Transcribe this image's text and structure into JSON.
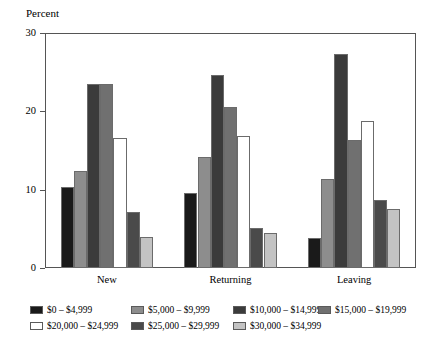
{
  "chart_data": {
    "type": "bar",
    "title": "",
    "subtitle": "",
    "xlabel": "",
    "ylabel": "Percent",
    "categories": [
      "New",
      "Returning",
      "Leaving"
    ],
    "ylim": [
      0,
      30
    ],
    "yticks": [
      0,
      10,
      20,
      30
    ],
    "ytick_labels": [
      "0",
      "10",
      "20",
      "30"
    ],
    "grid": false,
    "legend_position": "bottom",
    "series": [
      {
        "name": "$0 – $4,999",
        "color": "#1a1a1a",
        "values": [
          10.3,
          9.6,
          3.8
        ]
      },
      {
        "name": "$5,000 – $9,999",
        "color": "#8d8d8d",
        "values": [
          12.4,
          14.2,
          11.4
        ]
      },
      {
        "name": "$10,000 – $14,999",
        "color": "#3b3b3b",
        "values": [
          23.5,
          24.6,
          27.3
        ]
      },
      {
        "name": "$15,000 – $19,999",
        "color": "#707070",
        "values": [
          23.5,
          20.5,
          16.3
        ]
      },
      {
        "name": "$20,000 – $24,999",
        "color": "#ffffff",
        "values": [
          16.6,
          16.9,
          18.8
        ]
      },
      {
        "name": "$25,000 – $29,999",
        "color": "#4a4a4a",
        "values": [
          7.2,
          5.1,
          8.7
        ]
      },
      {
        "name": "$30,000 – $34,999",
        "color": "#c3c3c3",
        "values": [
          3.9,
          4.5,
          7.5
        ]
      }
    ]
  },
  "legend": {
    "rows": [
      [
        {
          "label": "$0 – $4,999",
          "color": "#1a1a1a",
          "left": 0
        },
        {
          "label": "$5,000 – $9,999",
          "color": "#8d8d8d",
          "left": 101
        },
        {
          "label": "$10,000 – $14,999",
          "color": "#3b3b3b",
          "left": 203
        },
        {
          "label": "$15,000 – $19,999",
          "color": "#707070",
          "left": 288
        }
      ],
      [
        {
          "label": "$20,000 – $24,999",
          "color": "#ffffff",
          "left": 0
        },
        {
          "label": "$25,000 – $29,999",
          "color": "#4a4a4a",
          "left": 101
        },
        {
          "label": "$30,000 – $34,999",
          "color": "#c3c3c3",
          "left": 203
        }
      ]
    ]
  }
}
